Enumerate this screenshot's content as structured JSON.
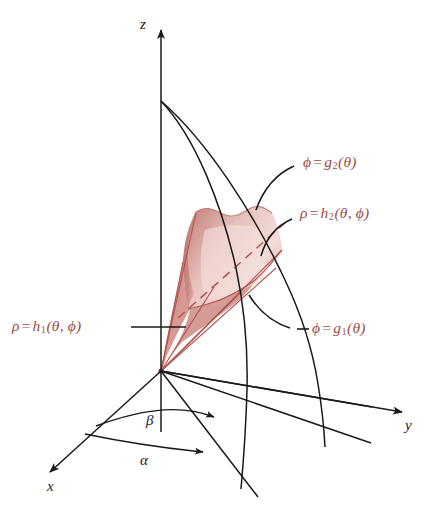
{
  "figure": {
    "colors": {
      "label_red": "#9e4a45",
      "ray_red": "#b4534c",
      "surface_dark_rose": "#c08079",
      "surface_light_pink": "#f0d5d2",
      "surface_mid_rose": "#dba9a3",
      "axis_black": "#1a1a1a"
    }
  },
  "axes": [
    {
      "name": "z-axis",
      "label": "z"
    },
    {
      "name": "y-axis",
      "label": "y"
    },
    {
      "name": "x-axis",
      "label": "x"
    }
  ],
  "angles": [
    {
      "name": "beta",
      "label": "β"
    },
    {
      "name": "alpha",
      "label": "α"
    }
  ],
  "labels": {
    "phi_upper": {
      "lhs": "ϕ",
      "op": "=",
      "fn": "g",
      "sub": "2",
      "args": "(θ)"
    },
    "rho_upper": {
      "lhs": "ρ",
      "op": "=",
      "fn": "h",
      "sub": "2",
      "args": "(θ, ϕ)"
    },
    "rho_lower": {
      "lhs": "ρ",
      "op": "=",
      "fn": "h",
      "sub": "1",
      "args": "(θ, ϕ)"
    },
    "phi_lower": {
      "lhs": "ϕ",
      "op": "=",
      "fn": "g",
      "sub": "1",
      "args": "(θ)"
    }
  }
}
